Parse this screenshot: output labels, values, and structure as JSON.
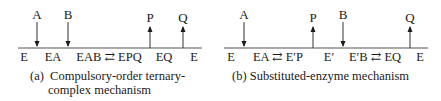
{
  "panels": {
    "a": {
      "substrates_products": [
        {
          "label": "A",
          "direction": "in",
          "x": 37
        },
        {
          "label": "B",
          "direction": "in",
          "x": 68
        },
        {
          "label": "P",
          "direction": "out",
          "x": 150
        },
        {
          "label": "Q",
          "direction": "out",
          "x": 183
        }
      ],
      "species": [
        {
          "label": "E",
          "x": 24
        },
        {
          "label": "EA",
          "x": 53
        },
        {
          "label": "EAB ⇄ EPQ",
          "x": 109
        },
        {
          "label": "EQ",
          "x": 164
        },
        {
          "label": "E",
          "x": 194
        }
      ],
      "caption_line1": "(a) Compulsory-order ternary-",
      "caption_line2": "complex mechanism"
    },
    "b": {
      "substrates_products": [
        {
          "label": "A",
          "direction": "in",
          "x": 24
        },
        {
          "label": "P",
          "direction": "out",
          "x": 93
        },
        {
          "label": "B",
          "direction": "in",
          "x": 123
        },
        {
          "label": "Q",
          "direction": "out",
          "x": 190
        }
      ],
      "species": [
        {
          "label": "E",
          "x": 11
        },
        {
          "label": "EA ⇄ E′P",
          "x": 58
        },
        {
          "label": "E′",
          "x": 109
        },
        {
          "label": "E′B ⇄ EQ",
          "x": 155
        },
        {
          "label": "E",
          "x": 200
        }
      ],
      "caption": "(b) Substituted-enzyme mechanism"
    }
  },
  "colors": {
    "line": "#555555",
    "text": "#1a1a1a"
  }
}
